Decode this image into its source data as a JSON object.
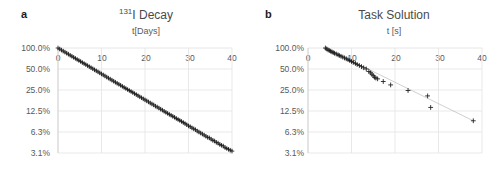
{
  "figure": {
    "background": "#ffffff",
    "width": 504,
    "height": 172
  },
  "panels": [
    {
      "letter": "a",
      "title_prefix": "",
      "title_sup": "131",
      "title_main": "I Decay",
      "axis_caption": "t[Days]",
      "chart_data": {
        "type": "scatter",
        "title": "131I Decay",
        "xlabel": "t[Days]",
        "ylabel": "",
        "yscale": "log2",
        "xlim": [
          0,
          40
        ],
        "ylim": [
          3.1,
          100.0
        ],
        "grid": true,
        "legend": "none",
        "marker": "plus",
        "marker_color": "#1a1a1a",
        "trendline": true,
        "trendline_color": "#9a9a9a",
        "xticks": [
          0,
          10,
          20,
          30,
          40
        ],
        "xticklabels": [
          "0",
          "10",
          "20",
          "30",
          "40"
        ],
        "yticks": [
          100.0,
          50.0,
          25.0,
          12.5,
          6.3,
          3.1
        ],
        "yticklabels": [
          "100.0%",
          "50.0%",
          "25.0%",
          "12.5%",
          "6.3%",
          "3.1%"
        ],
        "halflife_days": 8.02,
        "series": [
          {
            "name": "I-131 activity",
            "x": [
              0.0,
              0.4,
              0.8,
              1.2,
              1.6,
              2.0,
              2.4,
              2.8,
              3.2,
              3.6,
              4.0,
              4.4,
              4.8,
              5.2,
              5.6,
              6.0,
              6.4,
              6.8,
              7.2,
              7.6,
              8.0,
              8.4,
              8.8,
              9.2,
              9.6,
              10.0,
              10.4,
              10.8,
              11.2,
              11.6,
              12.0,
              12.4,
              12.8,
              13.2,
              13.6,
              14.0,
              14.4,
              14.8,
              15.2,
              15.6,
              16.0,
              16.4,
              16.8,
              17.2,
              17.6,
              18.0,
              18.4,
              18.8,
              19.2,
              19.6,
              20.0,
              20.4,
              20.8,
              21.2,
              21.6,
              22.0,
              22.4,
              22.8,
              23.2,
              23.6,
              24.0,
              24.4,
              24.8,
              25.2,
              25.6,
              26.0,
              26.4,
              26.8,
              27.2,
              27.6,
              28.0,
              28.4,
              28.8,
              29.2,
              29.6,
              30.0,
              30.4,
              30.8,
              31.2,
              31.6,
              32.0,
              32.4,
              32.8,
              33.2,
              33.6,
              34.0,
              34.4,
              34.8,
              35.2,
              35.6,
              36.0,
              36.4,
              36.8,
              37.2,
              37.6,
              38.0,
              38.4,
              38.8,
              39.2,
              39.6,
              40.0
            ],
            "y": [
              100.0,
              96.6,
              93.4,
              90.2,
              87.2,
              84.2,
              81.4,
              78.6,
              76.0,
              73.4,
              70.9,
              68.5,
              66.2,
              64.0,
              61.8,
              59.7,
              57.7,
              55.8,
              53.9,
              52.1,
              50.3,
              48.6,
              47.0,
              45.4,
              43.9,
              42.4,
              41.0,
              39.6,
              38.2,
              36.9,
              35.7,
              34.5,
              33.3,
              32.2,
              31.1,
              30.1,
              29.1,
              28.1,
              27.1,
              26.2,
              25.3,
              24.5,
              23.7,
              22.9,
              22.1,
              21.4,
              20.6,
              19.9,
              19.3,
              18.6,
              18.0,
              17.4,
              16.8,
              16.2,
              15.7,
              15.2,
              14.6,
              14.2,
              13.7,
              13.2,
              12.8,
              12.3,
              11.9,
              11.5,
              11.1,
              10.8,
              10.4,
              10.1,
              9.7,
              9.4,
              9.1,
              8.8,
              8.5,
              8.2,
              7.9,
              7.6,
              7.4,
              7.1,
              6.9,
              6.7,
              6.4,
              6.2,
              6.0,
              5.8,
              5.6,
              5.4,
              5.2,
              5.1,
              4.9,
              4.7,
              4.6,
              4.4,
              4.3,
              4.1,
              4.0,
              3.9,
              3.7,
              3.6,
              3.5,
              3.4,
              3.3
            ]
          }
        ]
      }
    },
    {
      "letter": "b",
      "title_prefix": "",
      "title_sup": "",
      "title_main": "Task Solution",
      "axis_caption": "t [s]",
      "chart_data": {
        "type": "scatter",
        "title": "Task Solution",
        "xlabel": "t [s]",
        "ylabel": "",
        "yscale": "log2",
        "xlim": [
          0,
          40
        ],
        "ylim": [
          3.1,
          100.0
        ],
        "grid": true,
        "legend": "none",
        "marker": "plus",
        "marker_color": "#1a1a1a",
        "trendline": true,
        "trendline_color": "#b0b0b0",
        "xticks": [
          0,
          10,
          20,
          30,
          40
        ],
        "xticklabels": [
          "0",
          "10",
          "20",
          "30",
          "40"
        ],
        "yticks": [
          100.0,
          50.0,
          25.0,
          12.5,
          6.3,
          3.1
        ],
        "yticklabels": [
          "100.0%",
          "50.0%",
          "25.0%",
          "12.5%",
          "6.3%",
          "3.1%"
        ],
        "series": [
          {
            "name": "Remaining tasks",
            "x": [
              4.0,
              4.3,
              4.6,
              4.9,
              5.2,
              5.5,
              5.8,
              6.1,
              6.5,
              6.9,
              7.2,
              7.6,
              8.0,
              8.4,
              8.8,
              9.2,
              9.6,
              10.0,
              10.4,
              10.9,
              11.3,
              11.8,
              12.3,
              12.8,
              13.4,
              14.0,
              14.4,
              14.7,
              15.0,
              15.3,
              15.6,
              16.0,
              17.3,
              19.0,
              23.0,
              27.5,
              28.2,
              38.0
            ],
            "y": [
              100.0,
              97.0,
              94.0,
              92.0,
              90.0,
              88.0,
              86.0,
              84.0,
              82.0,
              80.0,
              78.0,
              76.0,
              74.0,
              72.0,
              70.0,
              68.0,
              66.0,
              64.0,
              62.0,
              60.0,
              58.0,
              56.0,
              54.0,
              52.0,
              50.0,
              46.0,
              44.0,
              42.0,
              40.0,
              38.0,
              37.0,
              36.0,
              33.0,
              29.5,
              24.5,
              20.5,
              14.0,
              9.0
            ]
          }
        ]
      }
    }
  ]
}
